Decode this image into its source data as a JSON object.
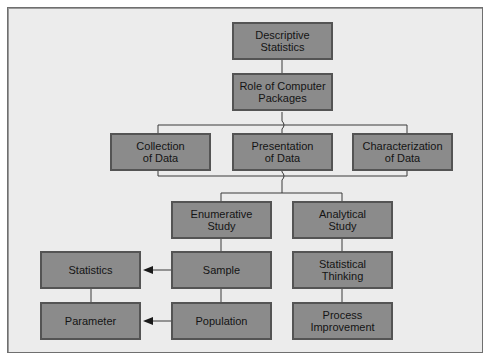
{
  "diagram": {
    "type": "hierarchy-flowchart",
    "colors": {
      "background": "#ececec",
      "box_fill": "#8b8b8b",
      "box_border": "#545454",
      "line": "#3a3a3a"
    },
    "nodes": {
      "descriptive_statistics": "Descriptive\nStatistics",
      "role_of_computer_packages": "Role of Computer\nPackages",
      "collection_of_data": "Collection\nof Data",
      "presentation_of_data": "Presentation\nof Data",
      "characterization_of_data": "Characterization\nof Data",
      "enumerative_study": "Enumerative\nStudy",
      "analytical_study": "Analytical\nStudy",
      "statistics": "Statistics",
      "sample": "Sample",
      "statistical_thinking": "Statistical\nThinking",
      "parameter": "Parameter",
      "population": "Population",
      "process_improvement": "Process\nImprovement"
    },
    "edges": [
      [
        "descriptive_statistics",
        "role_of_computer_packages"
      ],
      [
        "role_of_computer_packages",
        "collection_of_data"
      ],
      [
        "role_of_computer_packages",
        "presentation_of_data"
      ],
      [
        "role_of_computer_packages",
        "characterization_of_data"
      ],
      [
        "collection_of_data",
        "enumerative_study"
      ],
      [
        "presentation_of_data",
        "enumerative_study"
      ],
      [
        "characterization_of_data",
        "analytical_study"
      ],
      [
        "enumerative_study",
        "sample"
      ],
      [
        "sample",
        "population"
      ],
      [
        "analytical_study",
        "statistical_thinking"
      ],
      [
        "statistical_thinking",
        "process_improvement"
      ],
      [
        "statistics",
        "parameter"
      ],
      [
        "sample",
        "statistics",
        "arrow"
      ],
      [
        "population",
        "parameter",
        "arrow"
      ]
    ]
  }
}
